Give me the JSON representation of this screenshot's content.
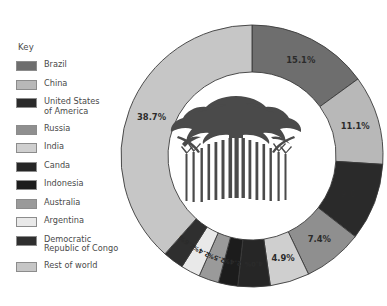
{
  "legend": {
    "title": "Key",
    "items": [
      {
        "label": "Brazil",
        "color": "#6e6e6e"
      },
      {
        "label": "China",
        "color": "#b8b8b8"
      },
      {
        "label": "United States\nof America",
        "color": "#2a2a2a"
      },
      {
        "label": "Russia",
        "color": "#8f8f8f"
      },
      {
        "label": "India",
        "color": "#cfcfcf"
      },
      {
        "label": "Canda",
        "color": "#262626"
      },
      {
        "label": "Indonesia",
        "color": "#1c1c1c"
      },
      {
        "label": "Australia",
        "color": "#9a9a9a"
      },
      {
        "label": "Argentina",
        "color": "#e9e9e9"
      },
      {
        "label": "Democratic\nRepublic of Congo",
        "color": "#2f2f2f"
      },
      {
        "label": "Rest of world",
        "color": "#c6c6c6"
      }
    ]
  },
  "center_image": {
    "name": "forest-silhouette",
    "color": "#4a4a4a",
    "description": "Silhouette of a stand of tall rainforest trees"
  },
  "chart_data": {
    "type": "pie",
    "variant": "donut",
    "title": "",
    "xlabel": "",
    "ylabel": "",
    "units": "%",
    "legend_position": "left",
    "grid": false,
    "start_angle_deg": 0,
    "direction": "clockwise",
    "categories": [
      "Brazil",
      "China",
      "United States of America",
      "Russia",
      "India",
      "Canda",
      "Indonesia",
      "Australia",
      "Argentina",
      "Democratic Republic of Congo",
      "Rest of world"
    ],
    "values": [
      15.1,
      11.1,
      9.6,
      7.4,
      4.9,
      4.0,
      2.4,
      2.5,
      2.4,
      2.6,
      38.7
    ],
    "labels": [
      "15.1%",
      "11.1%",
      "9.6%",
      "7.4%",
      "4.9%",
      "4.0%",
      "2.4%",
      "2.5%",
      "2.4%",
      "2.6%",
      "38.7%"
    ],
    "colors": [
      "#6e6e6e",
      "#b8b8b8",
      "#2a2a2a",
      "#8f8f8f",
      "#cfcfcf",
      "#262626",
      "#1c1c1c",
      "#9a9a9a",
      "#e9e9e9",
      "#2f2f2f",
      "#c6c6c6"
    ],
    "label_small": [
      false,
      false,
      false,
      false,
      false,
      true,
      true,
      true,
      true,
      true,
      false
    ]
  }
}
